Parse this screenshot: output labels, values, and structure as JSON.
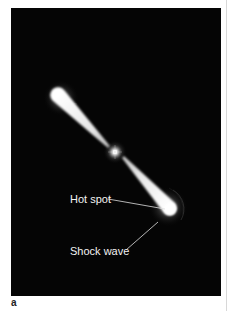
{
  "figure": {
    "panel_letter": "a",
    "background_color": "#050505",
    "annotations": [
      {
        "id": "hot-spot",
        "label": "Hot spot"
      },
      {
        "id": "shock-wave",
        "label": "Shock wave"
      }
    ],
    "elements": {
      "central_source": "bright point source at center",
      "jets": [
        "upper-left jet lobe",
        "lower-right jet lobe"
      ]
    }
  }
}
